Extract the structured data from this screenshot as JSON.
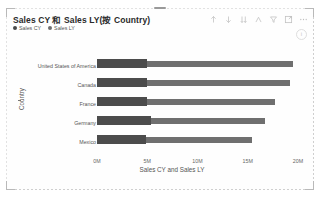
{
  "visual": {
    "title": "Sales CY 和 Sales LY(按 Country)",
    "info_badge": "i",
    "drag_handle": "drag-handle"
  },
  "actions": [
    {
      "name": "sort-ascending-icon",
      "label": "↑"
    },
    {
      "name": "sort-descending-icon",
      "label": "↓"
    },
    {
      "name": "sort-bars-icon",
      "label": "⇊"
    },
    {
      "name": "drill-down-icon",
      "label": "⌂"
    },
    {
      "name": "filter-icon",
      "label": "▽"
    },
    {
      "name": "focus-mode-icon",
      "label": "⛶"
    },
    {
      "name": "more-options-icon",
      "label": "…"
    }
  ],
  "legend": {
    "position": "top-left",
    "entries": [
      {
        "label": "Sales CY",
        "color": "#4a4a4a"
      },
      {
        "label": "Sales LY",
        "color": "#6e6e6e"
      }
    ]
  },
  "chart_data": {
    "type": "bar",
    "orientation": "horizontal",
    "title": "Sales CY 和 Sales LY(按 Country)",
    "xlabel": "Sales CY and Sales LY",
    "ylabel": "Country",
    "categories": [
      "United States of America",
      "Canada",
      "France",
      "Germany",
      "Mexico"
    ],
    "series": [
      {
        "name": "Sales CY",
        "color": "#4c4c4c",
        "values": [
          5000000,
          5000000,
          5000000,
          5400000,
          4900000
        ]
      },
      {
        "name": "Sales LY",
        "color": "#6f6f6f",
        "values": [
          19500000,
          19200000,
          17700000,
          16700000,
          15400000
        ]
      }
    ],
    "xlim": [
      0,
      20000000
    ],
    "xticks": [
      0,
      5000000,
      10000000,
      15000000,
      20000000
    ],
    "xtick_labels": [
      "0M",
      "5M",
      "10M",
      "15M",
      "20M"
    ],
    "grid": false,
    "legend_position": "top-left"
  }
}
